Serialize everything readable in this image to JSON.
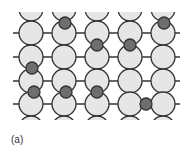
{
  "figure": {
    "caption": "(a)",
    "colors": {
      "host_fill": "#e6e6e6",
      "host_stroke": "#333333",
      "solute_fill": "#6e6e6e",
      "bond": "#333333",
      "background": "#ffffff"
    },
    "lattice": {
      "columns_x": [
        31,
        64,
        97,
        130,
        163
      ],
      "rows_y": [
        9,
        33,
        57,
        81,
        104,
        128
      ],
      "radius": 12,
      "bond_x_start": 13,
      "bond_x_end": 180,
      "clip_top": 12,
      "clip_bottom": 120
    },
    "solute_atoms": [
      {
        "x": 65,
        "y": 23
      },
      {
        "x": 164,
        "y": 23
      },
      {
        "x": 97,
        "y": 45
      },
      {
        "x": 130,
        "y": 45
      },
      {
        "x": 32,
        "y": 68
      },
      {
        "x": 34,
        "y": 92
      },
      {
        "x": 66,
        "y": 92
      },
      {
        "x": 97,
        "y": 92
      },
      {
        "x": 146,
        "y": 104
      }
    ],
    "solute_radius": 6
  }
}
